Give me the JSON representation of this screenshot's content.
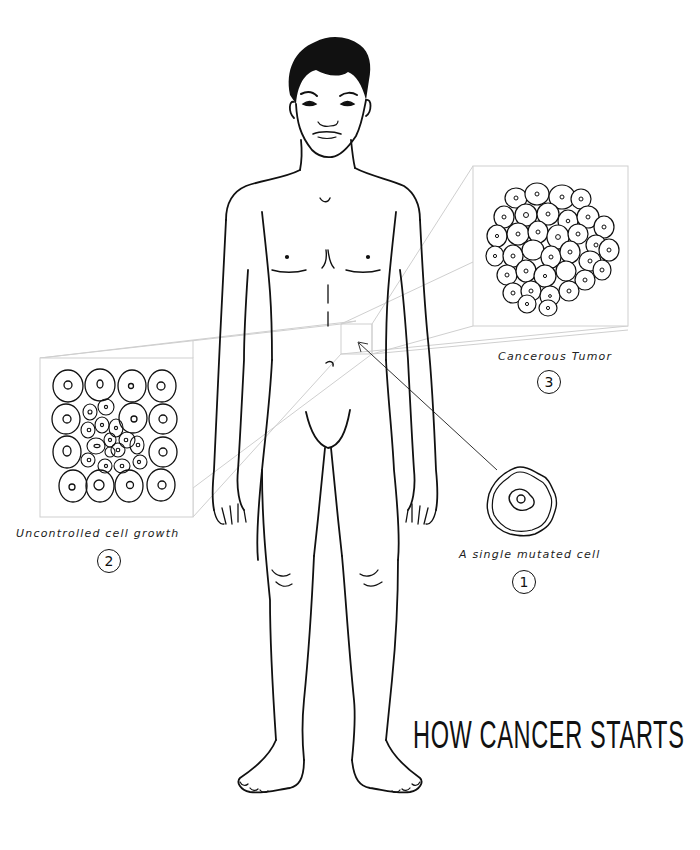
{
  "title": "HOW CANCER STARTS",
  "stages": [
    {
      "number": "1",
      "label": "A single mutated cell"
    },
    {
      "number": "2",
      "label": "Uncontrolled cell growth"
    },
    {
      "number": "3",
      "label": "Cancerous Tumor"
    }
  ],
  "colors": {
    "ink": "#111111",
    "guide_lines": "#c8c8c8",
    "background": "#ffffff"
  }
}
